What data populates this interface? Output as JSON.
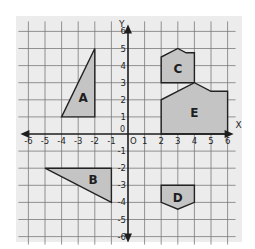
{
  "diagram": {
    "type": "coordinate-plane",
    "x_axis_label": "X",
    "y_axis_label": "Y",
    "origin_label": "O",
    "x_range": [
      -6,
      6
    ],
    "y_range": [
      -6,
      6
    ],
    "x_ticks": [
      "-6",
      "-5",
      "-4",
      "-3",
      "-2",
      "-1",
      "1",
      "2",
      "3",
      "4",
      "5",
      "6"
    ],
    "y_ticks": [
      "6",
      "5",
      "4",
      "3",
      "2",
      "1",
      "-1",
      "-2",
      "-3",
      "-4",
      "-5",
      "-6"
    ],
    "colors": {
      "background": "#ffffff",
      "panel": "#ececec",
      "grid": "#7a7a7a",
      "axis": "#1e1e1e",
      "shape_fill": "#c4c4c4",
      "shape_stroke": "#222222",
      "label": "#1e1e1e"
    },
    "shapes": [
      {
        "name": "A",
        "points": [
          [
            -4,
            1
          ],
          [
            -2,
            5
          ],
          [
            -2,
            1
          ]
        ],
        "label_pos": [
          -2.7,
          2.1
        ]
      },
      {
        "name": "B",
        "points": [
          [
            -5,
            -2
          ],
          [
            -1,
            -2
          ],
          [
            -1,
            -4
          ]
        ],
        "label_pos": [
          -2.1,
          -2.7
        ]
      },
      {
        "name": "C",
        "points": [
          [
            2,
            3
          ],
          [
            2,
            4.5
          ],
          [
            3,
            5
          ],
          [
            3.5,
            4.75
          ],
          [
            4,
            4.75
          ],
          [
            4,
            3
          ]
        ],
        "label_pos": [
          3,
          3.8
        ]
      },
      {
        "name": "D",
        "points": [
          [
            2,
            -3
          ],
          [
            4,
            -3
          ],
          [
            4,
            -4
          ],
          [
            3,
            -4.4
          ],
          [
            2,
            -4
          ]
        ],
        "label_pos": [
          3,
          -3.75
        ]
      },
      {
        "name": "E",
        "points": [
          [
            2,
            0
          ],
          [
            2,
            2
          ],
          [
            4,
            3
          ],
          [
            5,
            2.5
          ],
          [
            6,
            2.5
          ],
          [
            6,
            0
          ]
        ],
        "label_pos": [
          4,
          1.2
        ]
      }
    ]
  }
}
